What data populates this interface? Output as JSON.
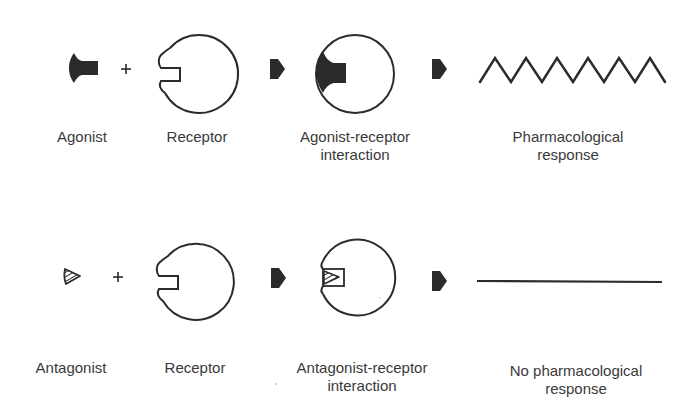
{
  "colors": {
    "ink": "#2b2b2b",
    "text": "#3a3a3a",
    "background": "#ffffff"
  },
  "rows": [
    {
      "name": "agonist-row",
      "ligand": {
        "label": "Agonist",
        "icon": "agonist-molecule-icon"
      },
      "operator": "+",
      "receptor": {
        "label": "Receptor",
        "icon": "receptor-icon"
      },
      "complex": {
        "label_line1": "Agonist-receptor",
        "label_line2": "interaction",
        "icon": "agonist-receptor-complex-icon"
      },
      "response": {
        "label_line1": "Pharmacological",
        "label_line2": "response",
        "icon": "zigzag-response-icon"
      }
    },
    {
      "name": "antagonist-row",
      "ligand": {
        "label": "Antagonist",
        "icon": "antagonist-molecule-icon"
      },
      "operator": "+",
      "receptor": {
        "label": "Receptor",
        "icon": "receptor-icon"
      },
      "complex": {
        "label_line1": "Antagonist-receptor",
        "label_line2": "interaction",
        "icon": "antagonist-receptor-complex-icon"
      },
      "response": {
        "label_line1": "No pharmacological",
        "label_line2": "response",
        "icon": "flat-line-icon"
      }
    }
  ]
}
